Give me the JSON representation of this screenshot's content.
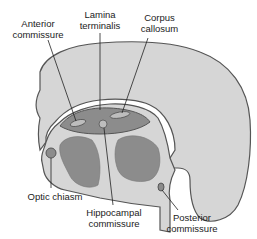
{
  "diagram": {
    "colors": {
      "hemisphere_fill": "#d6d6d6",
      "outline": "#555555",
      "commissural_plate": "#8c8c8c",
      "ventricle_fill": "#8c8c8c",
      "leader_line": "#222222"
    },
    "labels": {
      "anterior_commissure": {
        "line1": "Anterior",
        "line2": "commissure"
      },
      "lamina_terminalis": {
        "line1": "Lamina",
        "line2": "terminalis"
      },
      "corpus_callosum": {
        "line1": "Corpus",
        "line2": "callosum"
      },
      "optic_chiasm": {
        "line1": "Optic chiasm"
      },
      "hippocampal_commissure": {
        "line1": "Hippocampal",
        "line2": "commissure"
      },
      "posterior_commissure": {
        "line1": "Posterior",
        "line2": "commissure"
      }
    }
  }
}
